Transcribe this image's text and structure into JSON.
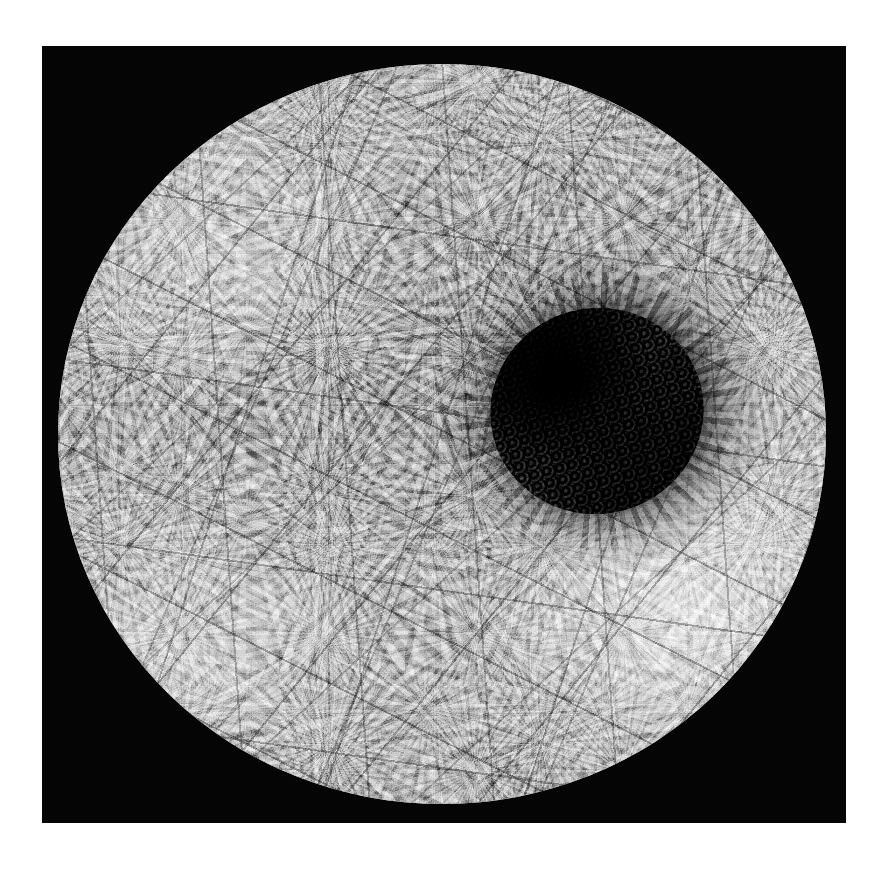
{
  "figure": {
    "kind": "grayscale-micrograph",
    "has_visible_text": false,
    "has_scale_bar": false,
    "has_axes": false,
    "has_legend": false,
    "caption": "",
    "alt_text": "Grayscale micrograph of a round specimen covered in overlapping fan-shaped crystalline plates, with a dark granular crater right of centre."
  },
  "canvas": {
    "width": 887,
    "height": 879,
    "background_color": "#ffffff"
  },
  "plate": {
    "label": "black mounting field",
    "x": 42,
    "y": 46,
    "width": 804,
    "height": 777,
    "color": "#050505"
  },
  "disc": {
    "label": "circular specimen",
    "center_x": 442,
    "center_y": 434,
    "width": 768,
    "height": 740,
    "base_color": "#9e9e9e",
    "highlight_color": "#e8e8e8",
    "shadow_color": "#3a3a3a"
  },
  "crater": {
    "label": "central dark cavity",
    "center_x": 597,
    "center_y": 411,
    "width": 214,
    "height": 206,
    "core_color": "#080808",
    "rim_color": "#c9c9c9",
    "texture": "granular rubble"
  },
  "texture": {
    "pattern": "fan-shaped spherulitic plates with radiating veins and dark inter-plate cracks",
    "crack_color": "#1c1c1c",
    "vein_color": "#2e2e2e"
  },
  "icons": {
    "none": ""
  }
}
